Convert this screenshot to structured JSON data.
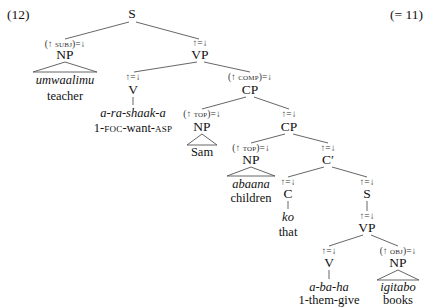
{
  "example": {
    "number": "(12)",
    "reference": "(= 11)"
  },
  "tree": {
    "root": {
      "label": "S"
    },
    "subj_np": {
      "annotation_prefix": "(↑ ",
      "annotation_fn": "subj",
      "annotation_suffix": ")=↓",
      "label": "NP",
      "word": "umwaalimu",
      "gloss": "teacher"
    },
    "vp1": {
      "annotation": "↑=↓",
      "label": "VP"
    },
    "v1": {
      "annotation": "↑=↓",
      "label": "V",
      "word": "a-ra-shaak-a",
      "gloss_parts": [
        "1-",
        "foc",
        "-want-",
        "asp"
      ]
    },
    "comp_cp": {
      "annotation_prefix": "(↑ ",
      "annotation_fn": "comp",
      "annotation_suffix": ")=↓",
      "label": "CP"
    },
    "top_np1": {
      "annotation_prefix": "(↑ ",
      "annotation_fn": "top",
      "annotation_suffix": ")=↓",
      "label": "NP",
      "word": "Sam"
    },
    "cp2": {
      "annotation": "↑=↓",
      "label": "CP"
    },
    "top_np2": {
      "annotation_prefix": "(↑ ",
      "annotation_fn": "top",
      "annotation_suffix": ")=↓",
      "label": "NP",
      "word": "abaana",
      "gloss": "children"
    },
    "cbar": {
      "annotation": "↑=↓",
      "label": "C′"
    },
    "c": {
      "annotation": "↑=↓",
      "label": "C",
      "word": "ko",
      "gloss": "that"
    },
    "s2": {
      "annotation": "↑=↓",
      "label": "S"
    },
    "vp2": {
      "annotation": "↑=↓",
      "label": "VP"
    },
    "v2": {
      "annotation": "↑=↓",
      "label": "V",
      "word": "a-ba-ha",
      "gloss": "1-them-give"
    },
    "obj_np": {
      "annotation_prefix": "(↑ ",
      "annotation_fn": "obj",
      "annotation_suffix": ")=↓",
      "label": "NP",
      "word": "igitabo",
      "gloss": "books"
    }
  }
}
